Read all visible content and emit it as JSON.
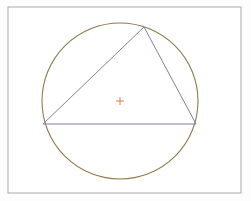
{
  "diagram": {
    "type": "circumscribed-circle",
    "frame": {
      "x": 8,
      "y": 7,
      "width": 233,
      "height": 186,
      "stroke": "#b8b8b8"
    },
    "circle": {
      "cx": 120,
      "cy": 101,
      "r": 78,
      "stroke": "#8c7b4e"
    },
    "triangle": {
      "vertices": [
        [
          144,
          27
        ],
        [
          43,
          124
        ],
        [
          196,
          124
        ]
      ],
      "stroke": "#7c82a4"
    },
    "center_marker": {
      "x": 120,
      "y": 101,
      "size": 4,
      "stroke": "#f07840"
    }
  }
}
